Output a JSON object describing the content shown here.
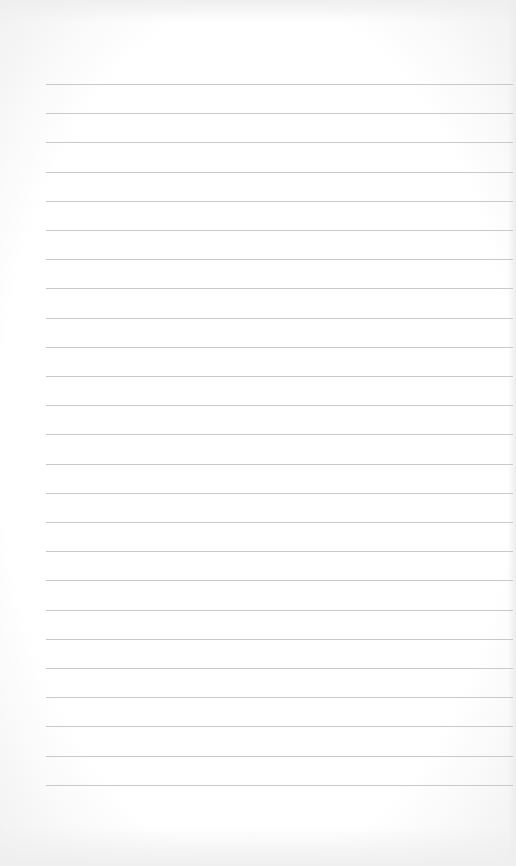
{
  "page": {
    "type": "lined-paper",
    "background_color": "#ffffff",
    "line_color": "#c9c9c9",
    "line_count": 25,
    "first_line_y": 84,
    "line_spacing": 29.2,
    "line_left": 46,
    "line_width": 467
  }
}
